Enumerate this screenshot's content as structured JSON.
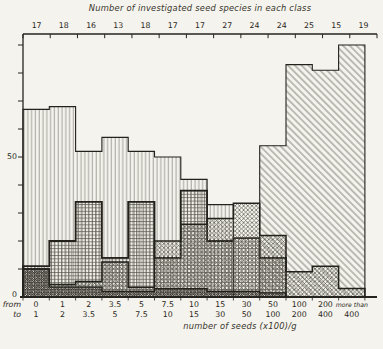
{
  "figure": {
    "top_title": "Number of investigated seed species in each class",
    "x_title": "number of seeds (x100)/g",
    "y_label_50": "50",
    "y_label_0": "0"
  },
  "chart_data": {
    "type": "bar",
    "subtype": "overlapping-step-histograms",
    "title": "Number of investigated seed species in each class",
    "xlabel": "number of seeds (x100)/g",
    "ylabel": "",
    "ylim": [
      0,
      94
    ],
    "y_tick_interval": 10,
    "y_labeled_ticks": [
      0,
      50
    ],
    "grid": "off",
    "legend": "none",
    "top_axis_counts": [
      17,
      18,
      16,
      13,
      18,
      17,
      17,
      27,
      24,
      24,
      25,
      15,
      19
    ],
    "class_from": [
      "0",
      "1",
      "2",
      "3.5",
      "5",
      "7.5",
      "10",
      "15",
      "30",
      "50",
      "100",
      "200",
      "more than"
    ],
    "class_to": [
      "1",
      "2",
      "3.5",
      "5",
      "7.5",
      "10",
      "15",
      "30",
      "50",
      "100",
      "200",
      "400",
      "400"
    ],
    "from_label": "from",
    "to_label": "to",
    "series": [
      {
        "name": "vertical-hatch",
        "hatch": "vertical",
        "values": [
          67,
          68,
          52,
          57,
          52,
          50,
          42,
          33,
          0,
          0,
          0,
          0,
          0
        ]
      },
      {
        "name": "diagonal-hatch",
        "hatch": "diagonal",
        "values": [
          0,
          0,
          0,
          0,
          0,
          0,
          0,
          0,
          0,
          54,
          83,
          81,
          90
        ]
      },
      {
        "name": "grid-hatch",
        "hatch": "grid",
        "values": [
          11,
          20,
          34,
          14,
          34,
          14,
          38,
          20,
          21,
          14,
          0,
          0,
          0
        ]
      },
      {
        "name": "diagonal-cross-hatch",
        "hatch": "diagcross",
        "values": [
          10,
          4.5,
          5.5,
          12.5,
          3.5,
          20,
          26,
          28,
          33.5,
          22,
          9,
          11,
          3
        ]
      },
      {
        "name": "dense-check-hatch",
        "hatch": "densecheck",
        "values": [
          10,
          3.5,
          3.5,
          2,
          2,
          3,
          3,
          2,
          2,
          1.5,
          0,
          0,
          0
        ]
      }
    ],
    "colors": {
      "axis": "#26241f",
      "outline": "#23211c",
      "hatch_light": "#8e8c83",
      "hatch_mid": "#55534b",
      "hatch_dark": "#34322c",
      "paper": "#f5f3ed"
    }
  }
}
